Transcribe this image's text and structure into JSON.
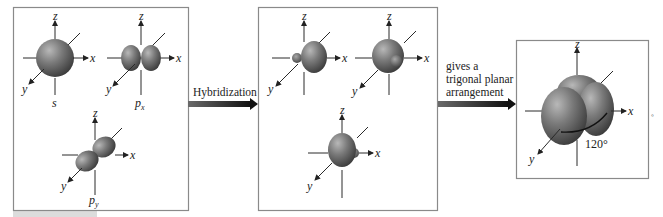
{
  "figure": {
    "type": "sp2 hybridization diagram",
    "colors": {
      "panel_border": "#8a8a8a",
      "orbital_light": "#9a9a9a",
      "orbital_dark": "#3f3f3f",
      "arrow": "#1f1f1f",
      "footer_bar": "#dcdcdc"
    }
  },
  "axes": {
    "x": "x",
    "y": "y",
    "z": "z"
  },
  "left_panel": {
    "orbitals": [
      {
        "label": "s",
        "subscript": ""
      },
      {
        "label": "p",
        "subscript": "x"
      },
      {
        "label": "p",
        "subscript": "y"
      }
    ]
  },
  "arrow1": {
    "label": "Hybridization"
  },
  "middle_panel": {
    "orbitals": [
      {
        "label": "sp2 hybrid 1"
      },
      {
        "label": "sp2 hybrid 2"
      },
      {
        "label": "sp2 hybrid 3"
      }
    ]
  },
  "arrow2": {
    "lines": [
      "gives a",
      "trigonal planar",
      "arrangement"
    ]
  },
  "right_panel": {
    "angle_label": "120°"
  }
}
